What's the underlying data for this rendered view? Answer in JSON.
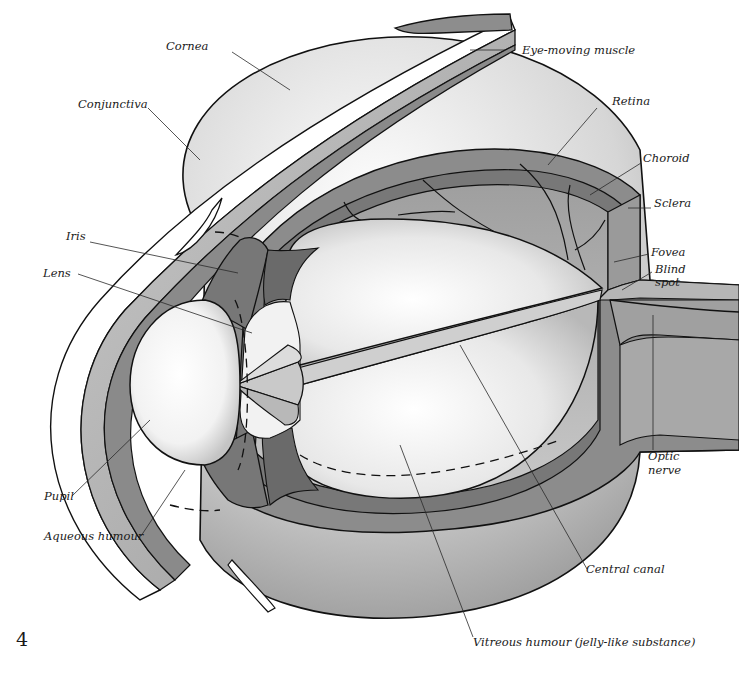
{
  "figure": {
    "page_number": "4",
    "labels": [
      {
        "id": "cornea",
        "text": "Cornea"
      },
      {
        "id": "eye-moving-muscle",
        "text": "Eye-moving muscle"
      },
      {
        "id": "conjunctiva",
        "text": "Conjunctiva"
      },
      {
        "id": "retina",
        "text": "Retina"
      },
      {
        "id": "choroid",
        "text": "Choroid"
      },
      {
        "id": "sclera",
        "text": "Sclera"
      },
      {
        "id": "iris",
        "text": "Iris"
      },
      {
        "id": "lens",
        "text": "Lens"
      },
      {
        "id": "fovea",
        "text": "Fovea"
      },
      {
        "id": "blind-spot",
        "text": [
          "Blind",
          "spot"
        ]
      },
      {
        "id": "optic-nerve",
        "text": [
          "Optic",
          "nerve"
        ]
      },
      {
        "id": "pupil",
        "text": "Pupil"
      },
      {
        "id": "aqueous-humour",
        "text": "Aqueous humour"
      },
      {
        "id": "central-canal",
        "text": "Central canal"
      },
      {
        "id": "vitreous-humour",
        "text": "Vitreous humour (jelly-like substance)"
      }
    ]
  },
  "colors": {
    "background": "#ffffff",
    "outline": "#111111",
    "light_grey": "#e2e2e2",
    "mid_grey": "#a9a9a9",
    "dark_grey": "#7a7a7a",
    "darker_grey": "#5e5e5e"
  }
}
